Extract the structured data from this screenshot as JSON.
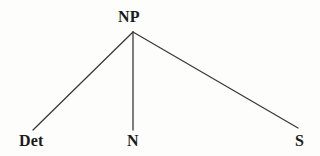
{
  "figure": {
    "kind": "syntax-tree",
    "background_color": "#fdfdfc",
    "line_color": "#3a3a3a",
    "text_color": "#1b1b1b"
  },
  "nodes": {
    "root": {
      "label": "NP",
      "x": 133,
      "y": 32
    },
    "children": [
      {
        "label": "Det",
        "x": 33,
        "y": 130
      },
      {
        "label": "N",
        "x": 133,
        "y": 130
      },
      {
        "label": "S",
        "x": 298,
        "y": 128
      }
    ]
  },
  "edges": [
    {
      "name": "edge-np-det",
      "x1": 133,
      "y1": 32,
      "x2": 33,
      "y2": 130
    },
    {
      "name": "edge-np-n",
      "x1": 133,
      "y1": 32,
      "x2": 133,
      "y2": 130
    },
    {
      "name": "edge-np-s",
      "x1": 133,
      "y1": 32,
      "x2": 298,
      "y2": 128
    }
  ]
}
